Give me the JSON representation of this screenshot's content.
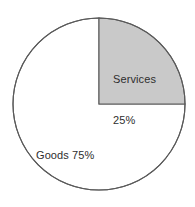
{
  "chart_data": {
    "type": "pie",
    "title": "",
    "subtitle": "",
    "xlabel": "",
    "ylabel": "",
    "categories": [
      "Goods",
      "Services"
    ],
    "values": [
      75,
      25
    ],
    "unit": "%",
    "legend_position": "inside-slices",
    "grid": false,
    "start_angle_deg": 0,
    "direction": "clockwise",
    "slices": [
      {
        "name": "Goods",
        "value": 75,
        "value_text": "75%",
        "label_text": "Goods 75%",
        "fill": "#ffffff",
        "stroke": "#5a5a5a",
        "start_angle_deg": 90,
        "end_angle_deg": 360
      },
      {
        "name": "Services",
        "value": 25,
        "value_text": "25%",
        "label_name_text": "Services",
        "label_value_text": "25%",
        "fill": "#c9c9c9",
        "stroke": "#5a5a5a",
        "start_angle_deg": 0,
        "end_angle_deg": 90
      }
    ],
    "geometry": {
      "center_x": 99,
      "center_y": 104,
      "radius": 86
    },
    "colors": {
      "background": "#ffffff",
      "outline": "#5a5a5a",
      "services_fill": "#c9c9c9",
      "goods_fill": "#ffffff",
      "label_text": "#2e2e2e"
    }
  }
}
